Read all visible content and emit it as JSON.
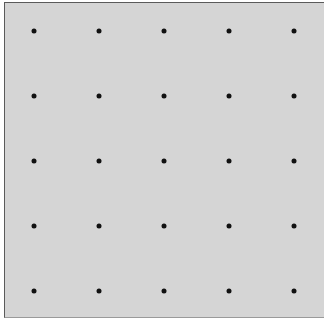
{
  "grid": {
    "rows": 5,
    "cols": 5,
    "x_positions": [
      34,
      99,
      164,
      229,
      294
    ],
    "y_positions": [
      31,
      96,
      161,
      226,
      291
    ],
    "dot_color": "#111111",
    "background_color": "#d5d5d5"
  }
}
